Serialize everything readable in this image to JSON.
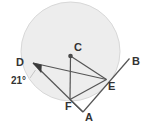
{
  "figure": {
    "kind": "circle-geometry-diagram",
    "canvas": {
      "width": 149,
      "height": 126
    },
    "background_color": "#ffffff",
    "stroke_color": "#555555",
    "label_color": "#333333"
  },
  "circle": {
    "name": "main-circle",
    "center_label": "C",
    "center": {
      "x": 70.5,
      "y": 51.5
    },
    "radius": 49.5,
    "fill_color": "#ededed",
    "stroke_color": "#d8d8d8"
  },
  "points": {
    "A": {
      "label": "A",
      "x": 83,
      "y": 112,
      "label_x": 85,
      "label_y": 121,
      "on_circle": false
    },
    "B": {
      "label": "B",
      "x": 129.5,
      "y": 58.5,
      "label_x": 132,
      "label_y": 65,
      "on_circle": false
    },
    "C": {
      "label": "C",
      "x": 70.5,
      "y": 56,
      "label_x": 74,
      "label_y": 51,
      "on_circle": false
    },
    "D": {
      "label": "D",
      "x": 33,
      "y": 63,
      "label_x": 16,
      "label_y": 66,
      "on_circle": true
    },
    "E": {
      "label": "E",
      "x": 106.5,
      "y": 79.5,
      "label_x": 108,
      "label_y": 90,
      "on_circle": true
    },
    "F": {
      "label": "F",
      "x": 70,
      "y": 99.5,
      "label_x": 65,
      "label_y": 110,
      "on_circle": true
    }
  },
  "segments": [
    {
      "name": "segment-D-E",
      "from": "D",
      "to": "E"
    },
    {
      "name": "segment-D-A",
      "from": "D",
      "to": "A"
    },
    {
      "name": "segment-C-E",
      "from": "C",
      "to": "E"
    },
    {
      "name": "segment-C-F",
      "from": "C",
      "to": "F"
    },
    {
      "name": "segment-F-E",
      "from": "F",
      "to": "E"
    },
    {
      "name": "segment-F-A",
      "from": "F",
      "to": "A"
    },
    {
      "name": "segment-A-B",
      "from": "A",
      "to": "B"
    }
  ],
  "angle_marks": [
    {
      "name": "angle-at-D",
      "vertex": "D",
      "value": "21°",
      "label_x": 12,
      "label_y": 84,
      "marker_fill": "#3a3a3a"
    }
  ]
}
